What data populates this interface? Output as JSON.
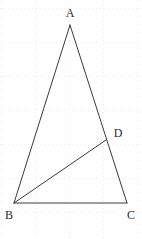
{
  "figure": {
    "width": 142,
    "height": 239,
    "background_color": "#ffffff",
    "stroke_color": "#3a3a3a",
    "stroke_width": 1,
    "label_color": "#2b2b2b",
    "label_font_size": 12
  },
  "grid": {
    "visible": true,
    "style": "dotted",
    "color": "#e9e9ef",
    "spacing": 34,
    "x_lines": [
      1,
      35,
      69,
      103,
      137
    ],
    "y_lines": [
      8,
      42,
      76,
      110,
      144,
      178,
      212
    ]
  },
  "points": [
    {
      "id": "A",
      "label": "A",
      "x": 70,
      "y": 25,
      "label_x": 70,
      "label_y": 13
    },
    {
      "id": "B",
      "label": "B",
      "x": 14,
      "y": 203,
      "label_x": 9,
      "label_y": 215
    },
    {
      "id": "C",
      "label": "C",
      "x": 127,
      "y": 203,
      "label_x": 131,
      "label_y": 215
    },
    {
      "id": "D",
      "label": "D",
      "x": 106,
      "y": 140,
      "label_x": 118,
      "label_y": 133
    }
  ],
  "segments": [
    {
      "id": "AB",
      "from": "A",
      "to": "B",
      "x1": 70,
      "y1": 25,
      "x2": 14,
      "y2": 203
    },
    {
      "id": "AC",
      "from": "A",
      "to": "C",
      "x1": 70,
      "y1": 25,
      "x2": 127,
      "y2": 203
    },
    {
      "id": "BC",
      "from": "B",
      "to": "C",
      "x1": 14,
      "y1": 203,
      "x2": 127,
      "y2": 203
    },
    {
      "id": "BD",
      "from": "B",
      "to": "D",
      "x1": 14,
      "y1": 203,
      "x2": 106,
      "y2": 140
    }
  ]
}
